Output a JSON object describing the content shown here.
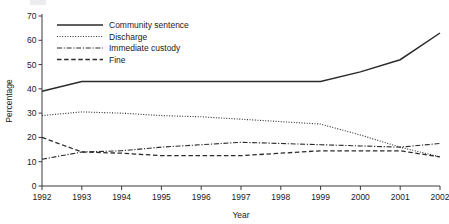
{
  "chart_data": {
    "type": "line",
    "title": "",
    "xlabel": "Year",
    "ylabel": "Percentage",
    "x": [
      1992,
      1993,
      1994,
      1995,
      1996,
      1997,
      1998,
      1999,
      2000,
      2001,
      2002
    ],
    "categories": [
      "1992",
      "1993",
      "1994",
      "1995",
      "1996",
      "1997",
      "1998",
      "1999",
      "2000",
      "2001",
      "2002"
    ],
    "xlim": [
      1992,
      2002
    ],
    "ylim": [
      0,
      70
    ],
    "yticks": [
      0,
      10,
      20,
      30,
      40,
      50,
      60,
      70
    ],
    "ytick_labels": [
      "0",
      "10",
      "20",
      "30",
      "40",
      "50",
      "60",
      "70"
    ],
    "grid": false,
    "legend_position": "top-left",
    "series": [
      {
        "name": "Community sentence",
        "style": "solid",
        "values": [
          39,
          43,
          43,
          43,
          43,
          43,
          43,
          43,
          47,
          52,
          63
        ]
      },
      {
        "name": "Discharge",
        "style": "dotted",
        "values": [
          29,
          30.5,
          30,
          29,
          28.5,
          27.5,
          26.5,
          25.5,
          21,
          16,
          12
        ]
      },
      {
        "name": "Immediate custody",
        "style": "dash-dot",
        "values": [
          11,
          14,
          14.5,
          16,
          17,
          18,
          17.5,
          17,
          16.5,
          16,
          17.5
        ]
      },
      {
        "name": "Fine",
        "style": "dashed",
        "values": [
          20,
          14,
          13.5,
          12.5,
          12.5,
          12.5,
          13.5,
          14.5,
          14.5,
          14.5,
          12
        ]
      }
    ]
  },
  "legend": {
    "items": [
      {
        "label": "Community sentence"
      },
      {
        "label": "Discharge"
      },
      {
        "label": "Immediate custody"
      },
      {
        "label": "Fine"
      }
    ]
  },
  "axes": {
    "x_title": "Year",
    "y_title": "Percentage"
  },
  "colors": {
    "line": "#2b2b2b",
    "axis": "#3a3a3a",
    "text": "#1a1a1a",
    "background": "#ffffff"
  }
}
